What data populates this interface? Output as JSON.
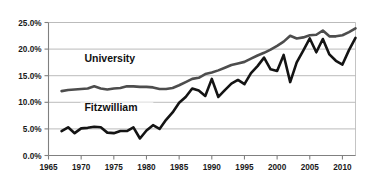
{
  "chart_data": {
    "type": "line",
    "title": "",
    "subtitle": "",
    "xlabel": "",
    "ylabel": "",
    "xlim": [
      1965,
      2012
    ],
    "ylim": [
      0,
      25
    ],
    "grid": true,
    "legend_position": "inline-annotation",
    "xticks": [
      "1965",
      "1970",
      "1975",
      "1980",
      "1985",
      "1990",
      "1995",
      "2000",
      "2005",
      "2010"
    ],
    "xtick_values": [
      1965,
      1970,
      1975,
      1980,
      1985,
      1990,
      1995,
      2000,
      2005,
      2010
    ],
    "yticks": [
      "0.0%",
      "5.0%",
      "10.0%",
      "15.0%",
      "20.0%",
      "25.0%"
    ],
    "ytick_values": [
      0,
      5,
      10,
      15,
      20,
      25
    ],
    "x": [
      1967,
      1968,
      1969,
      1970,
      1971,
      1972,
      1973,
      1974,
      1975,
      1976,
      1977,
      1978,
      1979,
      1980,
      1981,
      1982,
      1983,
      1984,
      1985,
      1986,
      1987,
      1988,
      1989,
      1990,
      1991,
      1992,
      1993,
      1994,
      1995,
      1996,
      1997,
      1998,
      1999,
      2000,
      2001,
      2002,
      2003,
      2004,
      2005,
      2006,
      2007,
      2008,
      2009,
      2010,
      2011,
      2012
    ],
    "series": [
      {
        "name": "University",
        "color": "#4d4d4d",
        "values": [
          12.1,
          12.3,
          12.4,
          12.5,
          12.6,
          13.0,
          12.6,
          12.4,
          12.6,
          12.7,
          13.0,
          13.0,
          12.9,
          12.9,
          12.8,
          12.5,
          12.5,
          12.7,
          13.2,
          13.8,
          14.4,
          14.6,
          15.3,
          15.6,
          16.0,
          16.5,
          17.0,
          17.3,
          17.6,
          18.2,
          18.8,
          19.3,
          19.9,
          20.6,
          21.4,
          22.5,
          22.0,
          22.2,
          22.6,
          22.7,
          23.5,
          22.4,
          22.4,
          22.6,
          23.2,
          23.9
        ]
      },
      {
        "name": "Fitzwilliam",
        "color": "#141414",
        "values": [
          4.6,
          5.3,
          4.2,
          5.1,
          5.2,
          5.4,
          5.3,
          4.3,
          4.2,
          4.6,
          4.6,
          5.3,
          3.2,
          4.7,
          5.7,
          5.0,
          6.7,
          8.1,
          9.9,
          11.0,
          12.6,
          12.2,
          11.2,
          14.4,
          11.0,
          12.3,
          13.5,
          14.2,
          13.4,
          15.5,
          16.8,
          18.4,
          16.2,
          15.9,
          18.9,
          13.8,
          17.5,
          19.7,
          22.0,
          19.4,
          21.9,
          19.0,
          17.8,
          17.1,
          19.8,
          22.1
        ]
      }
    ],
    "annotations": [
      {
        "text": "University",
        "x": 1970.5,
        "y": 17.6
      },
      {
        "text": "Fitzwilliam",
        "x": 1970.5,
        "y": 8.3
      }
    ]
  }
}
